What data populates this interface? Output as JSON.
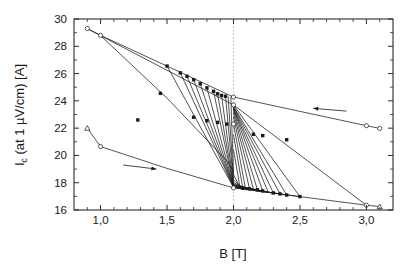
{
  "figure": {
    "background": "#ffffff",
    "frame_color": "#2b2b2b",
    "line_color": "#1a1a1a",
    "marker_fill_color": "#1a1a1a",
    "open_marker_fill": "#ffffff",
    "guide_color": "#b5b5b5"
  },
  "chart_data": {
    "type": "line",
    "title": "",
    "subtitle": "",
    "xlabel": "B [T]",
    "ylabel": "I_c (at 1 µV/cm) [A]",
    "ylabel_parts": {
      "main": "I",
      "subscript": "c",
      "rest": " (at 1 µV/cm) [A]"
    },
    "xlim": [
      0.8,
      3.2
    ],
    "ylim": [
      16,
      30
    ],
    "grid": false,
    "legend": null,
    "legend_position": "none",
    "x_major_ticks": [
      1.0,
      1.5,
      2.0,
      2.5,
      3.0
    ],
    "x_major_tick_labels": [
      "1,0",
      "1,5",
      "2,0",
      "2,5",
      "3,0"
    ],
    "x_minor_ticks": [
      0.9,
      1.1,
      1.2,
      1.3,
      1.4,
      1.6,
      1.7,
      1.8,
      1.9,
      2.1,
      2.2,
      2.3,
      2.4,
      2.6,
      2.7,
      2.8,
      2.9,
      3.1
    ],
    "y_major_ticks": [
      16,
      18,
      20,
      22,
      24,
      26,
      28,
      30
    ],
    "y_major_tick_labels": [
      "16",
      "18",
      "20",
      "22",
      "24",
      "26",
      "28",
      "30"
    ],
    "y_minor_ticks": [
      17,
      19,
      21,
      23,
      25,
      27,
      29
    ],
    "annotations": [
      {
        "name": "field-down-guide",
        "type": "vline",
        "x": 2.0,
        "style": "dotted",
        "color": "#b5b5b5",
        "label": ""
      },
      {
        "name": "arrow-decreasing-field",
        "type": "arrow",
        "x_from": 2.85,
        "y_from": 23.25,
        "x_to": 2.6,
        "y_to": 23.45,
        "direction": "left",
        "label": ""
      },
      {
        "name": "arrow-increasing-field",
        "type": "arrow",
        "x_from": 1.17,
        "y_from": 19.3,
        "x_to": 1.42,
        "y_to": 19.0,
        "direction": "right",
        "label": ""
      }
    ],
    "series": [
      {
        "name": "upper-envelope-decreasing-field",
        "marker": "open-circle",
        "points": [
          [
            3.1,
            21.98
          ],
          [
            3.0,
            22.18
          ],
          [
            2.0,
            24.28
          ],
          [
            1.5,
            26.55
          ],
          [
            1.0,
            28.8
          ],
          [
            0.9,
            29.3
          ]
        ]
      },
      {
        "name": "lower-envelope-increasing-field",
        "marker": "open-triangle-circle",
        "points": [
          [
            0.9,
            22.0
          ],
          [
            1.0,
            20.65
          ],
          [
            1.5,
            19.05
          ],
          [
            2.0,
            17.62
          ],
          [
            2.5,
            16.98
          ],
          [
            3.0,
            16.35
          ],
          [
            3.1,
            16.25
          ]
        ]
      },
      {
        "name": "major-loop-downstroke",
        "marker": "open-circle",
        "points": [
          [
            0.9,
            29.3
          ],
          [
            1.0,
            28.78
          ],
          [
            2.0,
            23.7
          ],
          [
            3.0,
            16.35
          ]
        ]
      },
      {
        "name": "minor-loop-01",
        "marker": "filled-square",
        "points": [
          [
            1.5,
            26.55
          ],
          [
            2.0,
            17.65
          ],
          [
            2.5,
            16.98
          ]
        ]
      },
      {
        "name": "minor-loop-02",
        "marker": "filled-square",
        "points": [
          [
            1.6,
            26.05
          ],
          [
            2.0,
            17.68
          ],
          [
            2.4,
            17.1
          ]
        ]
      },
      {
        "name": "minor-loop-03",
        "marker": "filled-square",
        "points": [
          [
            1.65,
            25.8
          ],
          [
            2.0,
            17.7
          ],
          [
            2.35,
            17.18
          ]
        ]
      },
      {
        "name": "minor-loop-04",
        "marker": "filled-square",
        "points": [
          [
            1.7,
            25.55
          ],
          [
            2.0,
            17.72
          ],
          [
            2.3,
            17.25
          ]
        ]
      },
      {
        "name": "minor-loop-05",
        "marker": "filled-square",
        "points": [
          [
            1.75,
            25.25
          ],
          [
            2.0,
            17.74
          ],
          [
            2.26,
            17.32
          ]
        ]
      },
      {
        "name": "minor-loop-06",
        "marker": "filled-square",
        "points": [
          [
            1.8,
            24.95
          ],
          [
            2.0,
            17.76
          ],
          [
            2.22,
            17.4
          ]
        ]
      },
      {
        "name": "minor-loop-07",
        "marker": "filled-square",
        "points": [
          [
            1.85,
            24.7
          ],
          [
            2.0,
            17.8
          ],
          [
            2.18,
            17.48
          ]
        ]
      },
      {
        "name": "minor-loop-08",
        "marker": "filled-square",
        "points": [
          [
            1.88,
            24.52
          ],
          [
            2.0,
            17.85
          ],
          [
            2.15,
            17.52
          ]
        ]
      },
      {
        "name": "minor-loop-09",
        "marker": "filled-square",
        "points": [
          [
            1.91,
            24.4
          ],
          [
            2.0,
            17.9
          ],
          [
            2.12,
            17.56
          ]
        ]
      },
      {
        "name": "minor-loop-10",
        "marker": "filled-square",
        "points": [
          [
            1.94,
            24.34
          ],
          [
            2.0,
            18.0
          ],
          [
            2.09,
            17.58
          ]
        ]
      },
      {
        "name": "minor-loop-11",
        "marker": "filled-square",
        "points": [
          [
            1.96,
            24.3
          ],
          [
            2.0,
            18.2
          ],
          [
            2.07,
            17.6
          ]
        ]
      },
      {
        "name": "minor-loop-12",
        "marker": "filled-square",
        "points": [
          [
            1.98,
            24.29
          ],
          [
            2.0,
            18.6
          ],
          [
            2.05,
            17.61
          ]
        ]
      },
      {
        "name": "return-branch-01",
        "marker": "filled-square",
        "points": [
          [
            2.5,
            16.98
          ],
          [
            2.0,
            23.7
          ]
        ]
      },
      {
        "name": "return-branch-02",
        "marker": "filled-square",
        "points": [
          [
            2.4,
            17.1
          ],
          [
            2.0,
            23.6
          ]
        ]
      },
      {
        "name": "return-branch-03",
        "marker": "filled-square",
        "points": [
          [
            2.35,
            17.18
          ],
          [
            2.0,
            23.55
          ]
        ]
      },
      {
        "name": "return-branch-04",
        "marker": "filled-square",
        "points": [
          [
            2.3,
            17.25
          ],
          [
            2.0,
            23.5
          ]
        ]
      },
      {
        "name": "return-branch-05",
        "marker": "filled-square",
        "points": [
          [
            2.26,
            17.32
          ],
          [
            2.0,
            23.45
          ]
        ]
      },
      {
        "name": "return-branch-06",
        "marker": "filled-square",
        "points": [
          [
            2.22,
            17.4
          ],
          [
            2.0,
            23.4
          ]
        ]
      },
      {
        "name": "return-branch-07",
        "marker": "filled-square",
        "points": [
          [
            2.18,
            17.48
          ],
          [
            2.0,
            23.3
          ]
        ]
      },
      {
        "name": "return-branch-08",
        "marker": "filled-square",
        "points": [
          [
            2.15,
            17.52
          ],
          [
            2.0,
            23.1
          ]
        ]
      },
      {
        "name": "return-branch-09",
        "marker": "filled-square",
        "points": [
          [
            2.12,
            17.56
          ],
          [
            2.0,
            22.8
          ]
        ]
      },
      {
        "name": "return-branch-10",
        "marker": "filled-square",
        "points": [
          [
            2.09,
            17.58
          ],
          [
            2.0,
            22.3
          ]
        ]
      },
      {
        "name": "return-branch-11",
        "marker": "filled-square",
        "points": [
          [
            2.07,
            17.6
          ],
          [
            2.0,
            21.5
          ]
        ]
      },
      {
        "name": "return-branch-12",
        "marker": "filled-square",
        "points": [
          [
            2.05,
            17.61
          ],
          [
            2.0,
            20.4
          ]
        ]
      },
      {
        "name": "mid-diagonal-branch",
        "marker": "filled-square",
        "points": [
          [
            1.0,
            28.78
          ],
          [
            1.5,
            24.2
          ],
          [
            1.95,
            19.6
          ],
          [
            2.0,
            18.9
          ]
        ]
      }
    ],
    "marker_points_filled": [
      [
        1.5,
        26.55
      ],
      [
        1.6,
        26.05
      ],
      [
        1.65,
        25.8
      ],
      [
        1.7,
        25.55
      ],
      [
        1.75,
        25.25
      ],
      [
        1.8,
        24.95
      ],
      [
        1.85,
        24.7
      ],
      [
        1.88,
        24.52
      ],
      [
        1.91,
        24.4
      ],
      [
        1.94,
        24.34
      ],
      [
        1.7,
        22.8
      ],
      [
        1.8,
        22.55
      ],
      [
        1.88,
        22.42
      ],
      [
        1.95,
        22.3
      ],
      [
        2.15,
        21.55
      ],
      [
        2.22,
        21.45
      ],
      [
        2.4,
        21.15
      ],
      [
        2.3,
        17.25
      ],
      [
        2.35,
        17.18
      ],
      [
        2.4,
        17.1
      ],
      [
        2.5,
        16.98
      ],
      [
        2.22,
        17.4
      ],
      [
        2.18,
        17.48
      ],
      [
        2.12,
        17.56
      ],
      [
        2.07,
        17.6
      ],
      [
        1.45,
        24.55
      ],
      [
        1.28,
        22.6
      ]
    ],
    "marker_points_open_circle": [
      [
        0.9,
        29.3
      ],
      [
        1.0,
        28.8
      ],
      [
        3.0,
        22.18
      ],
      [
        3.1,
        21.98
      ],
      [
        1.0,
        20.65
      ],
      [
        3.0,
        16.35
      ],
      [
        2.0,
        24.28
      ],
      [
        2.0,
        23.7
      ],
      [
        2.0,
        17.62
      ],
      [
        2.0,
        22.3
      ]
    ],
    "marker_points_open_triangle": [
      [
        0.9,
        22.0
      ],
      [
        3.1,
        16.25
      ]
    ]
  }
}
